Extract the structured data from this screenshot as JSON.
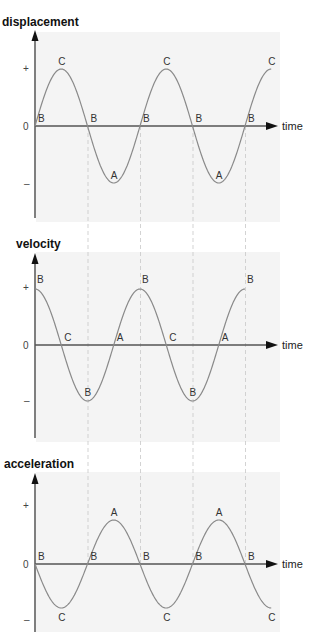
{
  "chart_data": [
    {
      "type": "line",
      "title": "displacement",
      "xlabel": "time",
      "ylabel": "displacement",
      "y_ticks": [
        "+",
        "0",
        "–"
      ],
      "function": "sin",
      "cycles": 2.25,
      "points": [
        {
          "label": "B",
          "phase": 0
        },
        {
          "label": "C",
          "phase": 0.25
        },
        {
          "label": "B",
          "phase": 0.5
        },
        {
          "label": "A",
          "phase": 0.75
        },
        {
          "label": "B",
          "phase": 1.0
        },
        {
          "label": "C",
          "phase": 1.25
        },
        {
          "label": "B",
          "phase": 1.5
        },
        {
          "label": "A",
          "phase": 1.75
        },
        {
          "label": "B",
          "phase": 2.0
        },
        {
          "label": "C",
          "phase": 2.25
        }
      ]
    },
    {
      "type": "line",
      "title": "velocity",
      "xlabel": "time",
      "ylabel": "velocity",
      "y_ticks": [
        "+",
        "0",
        "–"
      ],
      "function": "cos",
      "cycles": 2.0,
      "points": [
        {
          "label": "B",
          "phase": 0
        },
        {
          "label": "C",
          "phase": 0.25
        },
        {
          "label": "B",
          "phase": 0.5
        },
        {
          "label": "A",
          "phase": 0.75
        },
        {
          "label": "B",
          "phase": 1.0
        },
        {
          "label": "C",
          "phase": 1.25
        },
        {
          "label": "B",
          "phase": 1.5
        },
        {
          "label": "A",
          "phase": 1.75
        },
        {
          "label": "B",
          "phase": 2.0
        }
      ]
    },
    {
      "type": "line",
      "title": "acceleration",
      "xlabel": "time",
      "ylabel": "acceleration",
      "y_ticks": [
        "+",
        "0",
        "–"
      ],
      "function": "-sin",
      "cycles": 2.25,
      "points": [
        {
          "label": "B",
          "phase": 0
        },
        {
          "label": "C",
          "phase": 0.25
        },
        {
          "label": "B",
          "phase": 0.5
        },
        {
          "label": "A",
          "phase": 0.75
        },
        {
          "label": "B",
          "phase": 1.0
        },
        {
          "label": "C",
          "phase": 1.25
        },
        {
          "label": "B",
          "phase": 1.5
        },
        {
          "label": "A",
          "phase": 1.75
        },
        {
          "label": "B",
          "phase": 2.0
        },
        {
          "label": "C",
          "phase": 2.25
        }
      ]
    }
  ],
  "panels": {
    "displacement": {
      "title": "displacement",
      "plus": "+",
      "zero": "0",
      "minus": "–",
      "axis": "time"
    },
    "velocity": {
      "title": "velocity",
      "plus": "+",
      "zero": "0",
      "minus": "–",
      "axis": "time"
    },
    "acceleration": {
      "title": "acceleration",
      "plus": "+",
      "zero": "0",
      "minus": "–",
      "axis": "time"
    }
  },
  "colors": {
    "curve": "#8a8a8a",
    "axis": "#555555",
    "panel_bg": "#f4f4f4",
    "guide": "#c8c8c8"
  }
}
